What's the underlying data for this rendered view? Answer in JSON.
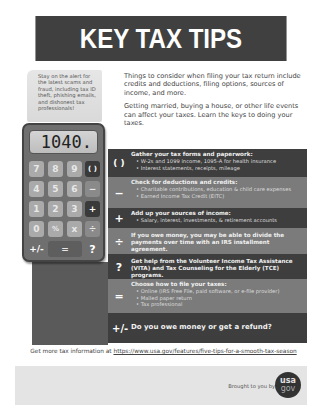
{
  "header": {
    "title": "KEY TAX TIPS"
  },
  "alert_note": {
    "text": "Stay on the alert for the latest scams and fraud, including tax ID theft, phishing emails, and dishonest tax professionals!"
  },
  "intro": {
    "paragraphs": [
      "Things to consider when filing your tax return include credits and deductions, filing options, sources of income, and more.",
      "Getting married, buying a house, or other life events can affect your taxes. Learn the keys to doing your taxes."
    ]
  },
  "calculator": {
    "display": "1040.",
    "keys": [
      "7",
      "8",
      "9",
      "( )",
      "4",
      "5",
      "6",
      "−",
      "1",
      "2",
      "3",
      "+",
      "0",
      "%",
      "x",
      "÷",
      "+/-",
      "=",
      "?"
    ]
  },
  "tips": [
    {
      "icon": "( )",
      "icon_name": "parentheses-icon",
      "title": "Gather your tax forms and paperwork:",
      "items": [
        "W-2s and 1099 income, 1095-A for health insurance",
        "Interest statements, receipts, mileage"
      ]
    },
    {
      "icon": "−",
      "icon_name": "minus-icon",
      "title": "Check for deductions and credits:",
      "items": [
        "Charitable contributions, education & child care expenses",
        "Earned Income Tax Credit (EITC)"
      ]
    },
    {
      "icon": "+",
      "icon_name": "plus-icon",
      "title": "Add up your sources of income:",
      "items": [
        "Salary, interest, investments, & retirement accounts"
      ]
    },
    {
      "icon": "÷",
      "icon_name": "divide-icon",
      "title": "If you owe money, you may be able to divide the payments over time with an IRS installment agreement.",
      "items": []
    },
    {
      "icon": "?",
      "icon_name": "question-icon",
      "title": "Get help from the Volunteer Income Tax Assistance (VITA) and Tax Counseling for the Elderly (TCE) programs.",
      "items": []
    },
    {
      "icon": "=",
      "icon_name": "equals-icon",
      "title": "Choose how to file your taxes:",
      "items": [
        "Online (IRS Free File, paid software, or e-file provider)",
        "Mailed paper return",
        "Tax professional"
      ]
    },
    {
      "icon": "+/-",
      "icon_name": "plus-minus-icon",
      "title": "Do you owe money or get a refund?",
      "items": []
    }
  ],
  "more_info": {
    "prefix": "Get more tax information at ",
    "link": "https://www.usa.gov/features/five-tips-for-a-smooth-tax-season"
  },
  "footer": {
    "brought_by": "Brought to you by",
    "logo_top": "usa",
    "logo_bottom": "gov"
  },
  "colors": {
    "header_bg": "#404040",
    "band_dark": "#3e3e3e",
    "band_mid": "#7b7b7b",
    "footer_bg": "#e4e4e4"
  }
}
